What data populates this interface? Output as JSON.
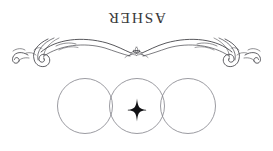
{
  "canvas": {
    "width": 273,
    "height": 151,
    "background_color": "#ffffff"
  },
  "emblem": {
    "name": "asher-emblem",
    "wordmark": {
      "text": "ASHER",
      "color": "#3a3a3c",
      "rotation_degrees": 180,
      "letter_spacing_px": 1.6,
      "font_size_px": 15.5
    },
    "ornament": {
      "icon": "calligraphic-flourish-icon",
      "stroke_color": "#45454a",
      "center_icon": "small-crown-flourish-icon",
      "symmetry": "horizontal-mirror"
    },
    "circles": {
      "icon": "three-overlapping-circles-icon",
      "count": 3,
      "stroke_color": "#7a7a82",
      "radius_px": 27,
      "centers_x_px": [
        85,
        137,
        188
      ],
      "center_y_px": 106
    },
    "sparkle": {
      "icon": "four-pointed-star-icon",
      "fill_color": "#111114",
      "points": 4,
      "center_x_px": 137,
      "center_y_px": 110
    }
  }
}
